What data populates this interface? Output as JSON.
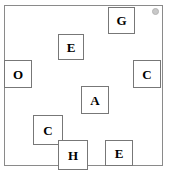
{
  "scene": {
    "width": 173,
    "height": 173,
    "background_color": "#ffffff",
    "frame": {
      "x": 4,
      "y": 5,
      "width": 159,
      "height": 161,
      "border_color": "#8a8a8a",
      "fill_color": "#ffffff"
    },
    "corner_marker": {
      "name": "corner-dot",
      "x": 152,
      "y": 8,
      "size": 7,
      "color": "#c8c8c8"
    }
  },
  "boxes": [
    {
      "id": "box-g",
      "label": "G",
      "x": 108,
      "y": 7,
      "width": 27,
      "height": 27,
      "border_color": "#777777",
      "fill_color": "#ffffff"
    },
    {
      "id": "box-e-top",
      "label": "E",
      "x": 58,
      "y": 34,
      "width": 26,
      "height": 26,
      "border_color": "#777777",
      "fill_color": "#ffffff"
    },
    {
      "id": "box-o",
      "label": "O",
      "x": 4,
      "y": 60,
      "width": 28,
      "height": 28,
      "border_color": "#777777",
      "fill_color": "#ffffff"
    },
    {
      "id": "box-c-right",
      "label": "C",
      "x": 133,
      "y": 60,
      "width": 28,
      "height": 28,
      "border_color": "#777777",
      "fill_color": "#ffffff"
    },
    {
      "id": "box-a",
      "label": "A",
      "x": 81,
      "y": 86,
      "width": 28,
      "height": 28,
      "border_color": "#777777",
      "fill_color": "#ffffff"
    },
    {
      "id": "box-c-lower",
      "label": "C",
      "x": 33,
      "y": 115,
      "width": 30,
      "height": 30,
      "border_color": "#777777",
      "fill_color": "#ffffff"
    },
    {
      "id": "box-h",
      "label": "H",
      "x": 58,
      "y": 140,
      "width": 30,
      "height": 30,
      "border_color": "#777777",
      "fill_color": "#ffffff"
    },
    {
      "id": "box-e-bottom",
      "label": "E",
      "x": 105,
      "y": 140,
      "width": 28,
      "height": 26,
      "border_color": "#777777",
      "fill_color": "#ffffff"
    }
  ]
}
